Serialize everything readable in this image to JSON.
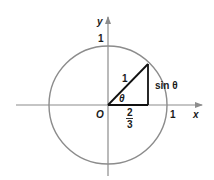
{
  "diagram": {
    "type": "unit-circle",
    "colors": {
      "circle": "#8c8c8c",
      "axes": "#8c8c8c",
      "triangle": "#111111",
      "text": "#1a1a1a",
      "background": "#ffffff"
    },
    "axes": {
      "x_label": "x",
      "y_label": "y",
      "origin_label": "O",
      "x_tick_label": "1",
      "y_tick_label": "1"
    },
    "triangle": {
      "hypotenuse_label": "1",
      "opposite_label": "sin θ",
      "angle_label": "θ",
      "adjacent_numerator": "2",
      "adjacent_denominator": "3"
    }
  }
}
